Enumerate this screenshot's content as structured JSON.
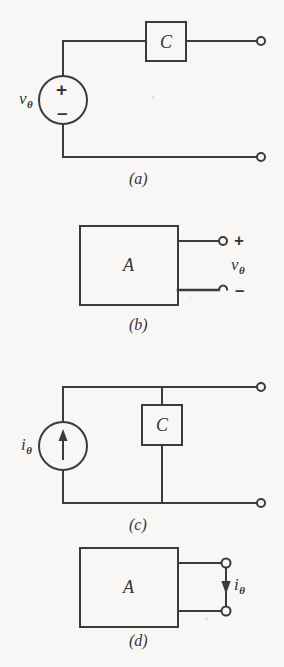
{
  "figure": {
    "background_color": "#f8f7f5",
    "line_color": "#3b3b3b",
    "panels": [
      {
        "id": "a",
        "caption": "(a)",
        "type": "thevenin-source-circuit",
        "source_label_symbol": "v",
        "source_label_subscript": "θ",
        "source_plus": "+",
        "source_minus": "–",
        "element_box_label": "C",
        "terminal_count": 2
      },
      {
        "id": "b",
        "caption": "(b)",
        "type": "black-box-voltage-port",
        "box_label": "A",
        "port_plus": "+",
        "port_minus": "–",
        "port_variable_symbol": "v",
        "port_variable_subscript": "θ",
        "terminal_count": 2
      },
      {
        "id": "c",
        "caption": "(c)",
        "type": "norton-source-circuit",
        "source_label_symbol": "i",
        "source_label_subscript": "θ",
        "source_arrow_direction": "up",
        "element_box_label": "C",
        "terminal_count": 2
      },
      {
        "id": "d",
        "caption": "(d)",
        "type": "black-box-current-port",
        "box_label": "A",
        "port_variable_symbol": "i",
        "port_variable_subscript": "θ",
        "port_arrow_direction": "down",
        "terminal_count": 2
      }
    ]
  }
}
